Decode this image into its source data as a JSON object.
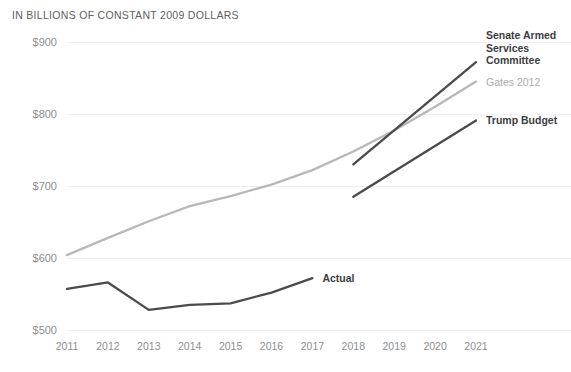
{
  "chart_data": {
    "type": "line",
    "title": "IN BILLIONS OF CONSTANT 2009 DOLLARS",
    "xlabel": "",
    "ylabel": "",
    "grid": true,
    "legend_position": "right-inline",
    "categories": [
      "2011",
      "2012",
      "2013",
      "2014",
      "2015",
      "2016",
      "2017",
      "2018",
      "2019",
      "2020",
      "2021"
    ],
    "x": [
      2011,
      2012,
      2013,
      2014,
      2015,
      2016,
      2017,
      2018,
      2019,
      2020,
      2021
    ],
    "xlim": [
      2011,
      2021
    ],
    "ylim": [
      500,
      900
    ],
    "yticks": [
      500,
      600,
      700,
      800,
      900
    ],
    "ytick_labels": [
      "$500",
      "$600",
      "$700",
      "$800",
      "$900"
    ],
    "xtick_labels": [
      "2011",
      "2012",
      "2013",
      "2014",
      "2015",
      "2016",
      "2017",
      "2018",
      "2019",
      "2020",
      "2021"
    ],
    "series": [
      {
        "name": "Actual",
        "color": "#4a4b4d",
        "width": 2.3,
        "x": [
          2011,
          2012,
          2013,
          2014,
          2015,
          2016,
          2017
        ],
        "values": [
          557,
          566,
          528,
          535,
          537,
          552,
          572
        ],
        "label": "Actual",
        "label_style": "bold-dark"
      },
      {
        "name": "Gates 2012",
        "color": "#b6b8ba",
        "width": 2.3,
        "x": [
          2011,
          2012,
          2013,
          2014,
          2015,
          2016,
          2017,
          2018,
          2019,
          2020,
          2021
        ],
        "values": [
          604,
          628,
          651,
          672,
          686,
          702,
          722,
          748,
          777,
          810,
          845
        ],
        "label": "Gates 2012",
        "label_style": "muted"
      },
      {
        "name": "Senate Armed Services Committee",
        "color": "#4a4b4d",
        "width": 2.3,
        "x": [
          2018,
          2021
        ],
        "values": [
          730,
          872
        ],
        "label": "Senate Armed\nServices\nCommittee",
        "label_style": "bold-dark"
      },
      {
        "name": "Trump Budget",
        "color": "#4a4b4d",
        "width": 2.3,
        "x": [
          2018,
          2021
        ],
        "values": [
          685,
          791
        ],
        "label": "Trump Budget",
        "label_style": "bold-dark"
      }
    ],
    "annotations": [],
    "source_note": ""
  },
  "colors": {
    "grid": "#f0f0f1",
    "tick_text": "#8e9092",
    "title_text": "#5f6061",
    "dark_series": "#4a4b4d",
    "light_series": "#b6b8ba",
    "background": "#ffffff"
  },
  "labels": {
    "actual": "Actual",
    "gates": "Gates 2012",
    "sasc": "Senate Armed\nServices\nCommittee",
    "trump": "Trump Budget"
  }
}
